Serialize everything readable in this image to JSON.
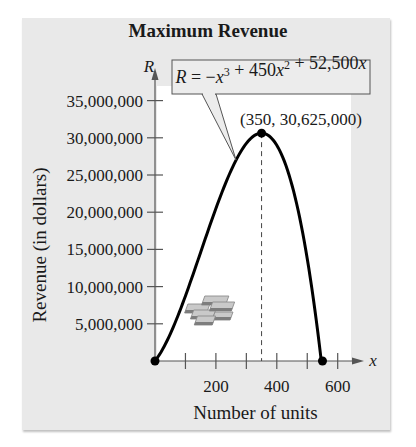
{
  "chart_data": {
    "type": "line",
    "title": "Maximum Revenue",
    "xlabel": "Number of units",
    "ylabel": "Revenue (in dollars)",
    "x_axis_symbol": "x",
    "y_axis_symbol": "R",
    "equation": "R = −x³ + 450x² + 52,500x",
    "annotation": "(350, 30,625,000)",
    "xlim": [
      0,
      680
    ],
    "ylim": [
      0,
      37000000
    ],
    "x_ticks": [
      100,
      200,
      300,
      400,
      500,
      600
    ],
    "x_tick_labels": [
      "200",
      "400",
      "600"
    ],
    "y_ticks": [
      5000000,
      10000000,
      15000000,
      20000000,
      25000000,
      30000000,
      35000000
    ],
    "y_tick_labels": [
      "5,000,000",
      "10,000,000",
      "15,000,000",
      "20,000,000",
      "25,000,000",
      "30,000,000",
      "35,000,000"
    ],
    "grid": false,
    "series": [
      {
        "name": "R = -x^3 + 450x^2 + 52,500x",
        "x": [
          0,
          50,
          100,
          150,
          200,
          250,
          300,
          350,
          400,
          450,
          500,
          550
        ],
        "values": [
          0,
          3625000,
          8750000,
          14625000,
          20500000,
          25625000,
          29250000,
          30625000,
          29000000,
          23625000,
          13750000,
          0
        ]
      }
    ],
    "points": [
      {
        "x": 0,
        "y": 0,
        "label": ""
      },
      {
        "x": 350,
        "y": 30625000,
        "label": "(350, 30,625,000)"
      },
      {
        "x": 550,
        "y": 0,
        "label": ""
      }
    ],
    "decoration": "money-stack-icon"
  },
  "chart": {
    "title": "Maximum Revenue",
    "xlabel": "Number of units",
    "ylabel": "Revenue (in dollars)",
    "x_symbol": "x",
    "y_symbol": "R",
    "annotation": "(350, 30,625,000)"
  }
}
